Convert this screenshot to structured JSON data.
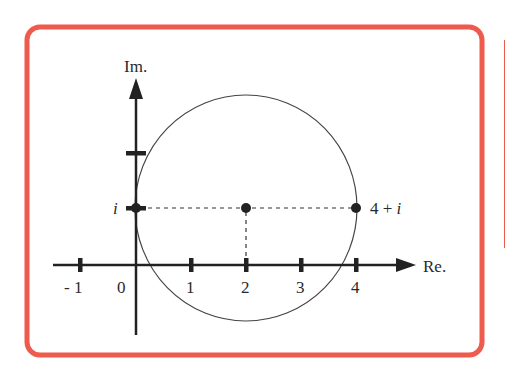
{
  "frame": {
    "color": "#ee5b4d"
  },
  "diagram": {
    "axes": {
      "x_label": "Re.",
      "y_label": "Im."
    },
    "x_ticks": [
      {
        "value": -1,
        "label": "- 1"
      },
      {
        "value": 0,
        "label": "0"
      },
      {
        "value": 1,
        "label": "1"
      },
      {
        "value": 2,
        "label": "2"
      },
      {
        "value": 3,
        "label": "3"
      },
      {
        "value": 4,
        "label": "4"
      }
    ],
    "y_ticks": [
      {
        "value": 1,
        "label": "i"
      },
      {
        "value": 2,
        "label": ""
      }
    ],
    "points": [
      {
        "name": "i",
        "re": 0,
        "im": 1,
        "label": "i"
      },
      {
        "name": "center",
        "re": 2,
        "im": 1,
        "label": ""
      },
      {
        "name": "4+i",
        "re": 4,
        "im": 1,
        "label": "4 + i"
      }
    ],
    "circle": {
      "center_re": 2,
      "center_im": 1,
      "radius": 2
    }
  }
}
